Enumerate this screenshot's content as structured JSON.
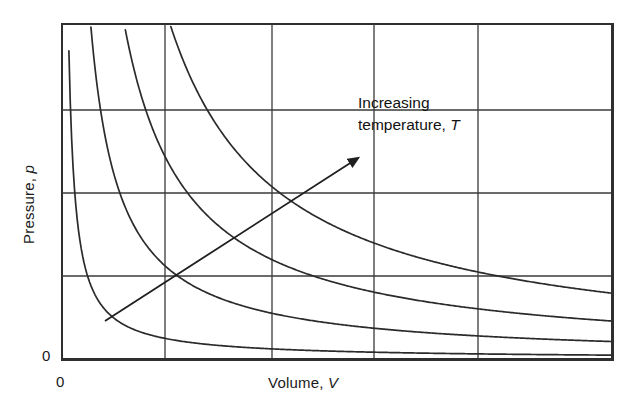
{
  "figure": {
    "background_color": "#ffffff",
    "line_color": "#2b2b2b",
    "grid_color": "#3a3a3a",
    "text_color": "#1a1a1a"
  },
  "axes": {
    "y_label_text": "Pressure, ",
    "y_label_symbol": "p",
    "x_label_text": "Volume, ",
    "x_label_symbol": "V",
    "y_origin_tick": "0",
    "x_origin_tick": "0"
  },
  "annotation": {
    "line1": "Increasing",
    "line2_text": "temperature, ",
    "line2_symbol": "T",
    "arrow_name": "increasing-temperature-arrow"
  },
  "chart_data": {
    "type": "line",
    "title": "",
    "xlabel": "Volume, V",
    "ylabel": "Pressure, p",
    "xlim": [
      0,
      1
    ],
    "ylim": [
      0,
      1
    ],
    "grid": true,
    "grid_x": [
      0.186,
      0.381,
      0.566,
      0.755
    ],
    "grid_y": [
      0.253,
      0.503,
      0.751
    ],
    "legend": "none",
    "annotations": [
      {
        "text": "Increasing temperature, T",
        "arrow_from": [
          0.08,
          0.12
        ],
        "arrow_to": [
          0.55,
          0.61
        ]
      }
    ],
    "series": [
      {
        "name": "isotherm-1",
        "constant": 0.0115,
        "comment": "lowest temperature",
        "x": [
          0.022,
          0.03,
          0.04,
          0.055,
          0.075,
          0.1,
          0.14,
          0.19,
          0.26,
          0.35,
          0.46,
          0.58,
          0.72,
          0.86,
          1.0
        ],
        "y": [
          0.523,
          0.383,
          0.288,
          0.209,
          0.153,
          0.115,
          0.082,
          0.061,
          0.044,
          0.033,
          0.025,
          0.02,
          0.016,
          0.013,
          0.0115
        ]
      },
      {
        "name": "isotherm-2",
        "constant": 0.052,
        "comment": "second temperature",
        "x": [
          0.055,
          0.07,
          0.09,
          0.115,
          0.15,
          0.2,
          0.26,
          0.34,
          0.44,
          0.56,
          0.7,
          0.85,
          1.0
        ],
        "y": [
          0.945,
          0.743,
          0.578,
          0.452,
          0.347,
          0.26,
          0.2,
          0.153,
          0.118,
          0.093,
          0.074,
          0.061,
          0.052
        ]
      },
      {
        "name": "isotherm-3",
        "constant": 0.113,
        "comment": "third temperature",
        "x": [
          0.12,
          0.15,
          0.19,
          0.24,
          0.3,
          0.38,
          0.47,
          0.57,
          0.69,
          0.83,
          1.0
        ],
        "y": [
          0.942,
          0.753,
          0.595,
          0.471,
          0.377,
          0.297,
          0.24,
          0.198,
          0.164,
          0.136,
          0.113
        ]
      },
      {
        "name": "isotherm-4",
        "constant": 0.196,
        "comment": "highest temperature",
        "x": [
          0.205,
          0.25,
          0.31,
          0.38,
          0.46,
          0.55,
          0.65,
          0.76,
          0.88,
          1.0
        ],
        "y": [
          0.955,
          0.784,
          0.632,
          0.516,
          0.426,
          0.356,
          0.302,
          0.258,
          0.223,
          0.196
        ]
      }
    ]
  }
}
